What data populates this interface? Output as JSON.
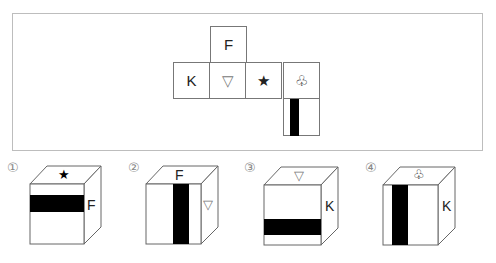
{
  "net": {
    "top": "F",
    "row": [
      "K",
      "▽",
      "★",
      "♧"
    ],
    "bottom_bar": "vertical-black-band"
  },
  "options": [
    {
      "number": "①",
      "top": "★",
      "right": "F",
      "front_band": "horizontal"
    },
    {
      "number": "②",
      "top": "F",
      "right": "▽",
      "front_band": "vertical"
    },
    {
      "number": "③",
      "top": "▽",
      "right": "K",
      "front_band": "horizontal-low"
    },
    {
      "number": "④",
      "top": "♧",
      "right": "K",
      "front_band": "vertical-left"
    }
  ],
  "colors": {
    "border": "#777777",
    "band": "#000000",
    "frame": "#bdbdbd",
    "number": "#888888"
  }
}
